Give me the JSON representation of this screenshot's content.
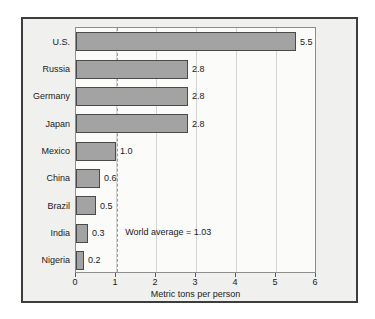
{
  "chart_data": {
    "type": "bar",
    "orientation": "horizontal",
    "title": "",
    "xlabel": "Metric tons per person",
    "ylabel": "",
    "xlim": [
      0,
      6
    ],
    "xticks": [
      "0",
      "1",
      "2",
      "3",
      "4",
      "5",
      "6"
    ],
    "grid": true,
    "legend": "none",
    "categories": [
      "U.S.",
      "Russia",
      "Germany",
      "Japan",
      "Mexico",
      "China",
      "Brazil",
      "India",
      "Nigeria"
    ],
    "values": [
      5.5,
      2.8,
      2.8,
      2.8,
      1.0,
      0.6,
      0.5,
      0.3,
      0.2
    ],
    "value_labels": [
      "5.5",
      "2.8",
      "2.8",
      "2.8",
      "1.0",
      "0.6",
      "0.5",
      "0.3",
      "0.2"
    ],
    "annotations": [
      {
        "text": "World average = 1.03",
        "value": 1.03,
        "kind": "reference-line-label",
        "line_style": "dashed"
      }
    ],
    "colors": {
      "bar_fill": "#a3a3a3",
      "bar_border": "#4a4a4a",
      "plot_background": "#fbfbfa",
      "figure_background": "#f0f0ee",
      "figure_border": "#3d3d3d",
      "gridline": "#d3d3d3",
      "reference_line": "#9a9a9a",
      "text": "#1a1a1a"
    }
  }
}
